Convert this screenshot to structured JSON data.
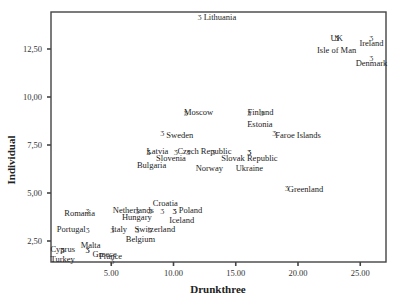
{
  "chart_data": {
    "type": "scatter",
    "title": "",
    "xlabel": "Drunkthree",
    "ylabel": "Individual",
    "xlim": [
      0.2,
      27.2
    ],
    "ylim": [
      1.4,
      14.4
    ],
    "x_ticks": [
      5,
      10,
      15,
      20,
      25
    ],
    "x_tick_labels": [
      "5.00",
      "10.00",
      "15.00",
      "20.00",
      "25.00"
    ],
    "y_ticks": [
      2.5,
      5,
      7.5,
      10,
      12.5
    ],
    "y_tick_labels": [
      "2,50",
      "5,00",
      "7,50",
      "10,00",
      "12,50"
    ],
    "grid": false,
    "legend": null,
    "points": [
      {
        "label": "Lithuania",
        "x": 12.1,
        "y": 14.2,
        "dx": 4,
        "dy": 4,
        "anchor": "start"
      },
      {
        "label": "UK",
        "x": 23.1,
        "y": 13.1,
        "dx": -6,
        "dy": 4,
        "anchor": "start"
      },
      {
        "label": "Isle of Man",
        "x": 23.1,
        "y": 13.1,
        "dx": 0,
        "dy": 16,
        "anchor": "middle"
      },
      {
        "label": "Ireland",
        "x": 25.9,
        "y": 13.1,
        "dx": 0,
        "dy": 9,
        "anchor": "middle"
      },
      {
        "label": "Denmark",
        "x": 25.9,
        "y": 12.1,
        "dx": 0,
        "dy": 9,
        "anchor": "middle"
      },
      {
        "label": "Moscow",
        "x": 11.0,
        "y": 9.2,
        "dx": -2,
        "dy": 3,
        "anchor": "start"
      },
      {
        "label": "Finland",
        "x": 16.1,
        "y": 9.2,
        "dx": -2,
        "dy": 3,
        "anchor": "start"
      },
      {
        "label": "Estonia",
        "x": 17.1,
        "y": 9.2,
        "dx": -2,
        "dy": 15,
        "anchor": "middle"
      },
      {
        "label": "Sweden",
        "x": 9.1,
        "y": 8.2,
        "dx": 4,
        "dy": 6,
        "anchor": "start"
      },
      {
        "label": "Faroe Islands",
        "x": 18.1,
        "y": 8.2,
        "dx": 1,
        "dy": 6,
        "anchor": "start"
      },
      {
        "label": "Latvia",
        "x": 8.0,
        "y": 7.2,
        "dx": -2,
        "dy": 3,
        "anchor": "start"
      },
      {
        "label": "Bulgaria",
        "x": 8.0,
        "y": 7.2,
        "dx": 3,
        "dy": 17,
        "anchor": "middle"
      },
      {
        "label": "Slovenia",
        "x": 10.2,
        "y": 7.2,
        "dx": -5,
        "dy": 10,
        "anchor": "middle"
      },
      {
        "label": "Czech Republic",
        "x": 11.2,
        "y": 7.2,
        "dx": -11,
        "dy": 3,
        "anchor": "start"
      },
      {
        "label": "Norway",
        "x": 13.2,
        "y": 7.2,
        "dx": -4,
        "dy": 20,
        "anchor": "middle"
      },
      {
        "label": "Slovak Republic",
        "x": 16.1,
        "y": 7.2,
        "dx": 0,
        "dy": 10,
        "anchor": "middle"
      },
      {
        "label": "Ukraine",
        "x": 16.1,
        "y": 7.2,
        "dx": 0,
        "dy": 20,
        "anchor": "middle"
      },
      {
        "label": "Greenland",
        "x": 19.1,
        "y": 5.3,
        "dx": 1,
        "dy": 5,
        "anchor": "start"
      },
      {
        "label": "Croatia",
        "x": 9.1,
        "y": 4.1,
        "dx": 3,
        "dy": -4,
        "anchor": "middle"
      },
      {
        "label": "Poland",
        "x": 10.1,
        "y": 4.1,
        "dx": 4,
        "dy": 3,
        "anchor": "start"
      },
      {
        "label": "Iceland",
        "x": 10.1,
        "y": 4.1,
        "dx": 7,
        "dy": 13,
        "anchor": "middle"
      },
      {
        "label": "Netherlands",
        "x": 7.1,
        "y": 4.1,
        "dx": -4,
        "dy": 3,
        "anchor": "middle"
      },
      {
        "label": "Hungary",
        "x": 8.1,
        "y": 4.1,
        "dx": -13,
        "dy": 10,
        "anchor": "middle"
      },
      {
        "label": "Romania",
        "x": 3.1,
        "y": 4.1,
        "dx": -8,
        "dy": 6,
        "anchor": "middle"
      },
      {
        "label": "Portugal",
        "x": 3.1,
        "y": 3.1,
        "dx": -2,
        "dy": 3,
        "anchor": "end"
      },
      {
        "label": "Italy",
        "x": 5.1,
        "y": 3.1,
        "dx": -1,
        "dy": 3,
        "anchor": "start"
      },
      {
        "label": "Belgium",
        "x": 7.1,
        "y": 3.1,
        "dx": 3,
        "dy": 13,
        "anchor": "middle"
      },
      {
        "label": "Switzerland",
        "x": 8.1,
        "y": 3.1,
        "dx": 5,
        "dy": 3,
        "anchor": "middle"
      },
      {
        "label": "Malta",
        "x": 3.1,
        "y": 2.1,
        "dx": 3,
        "dy": -1,
        "anchor": "middle"
      },
      {
        "label": "Greece",
        "x": 3.1,
        "y": 2.1,
        "dx": 5,
        "dy": 8,
        "anchor": "start"
      },
      {
        "label": "Cyprus",
        "x": 1.1,
        "y": 2.1,
        "dx": 0,
        "dy": 3,
        "anchor": "middle"
      },
      {
        "label": "Turkey",
        "x": 1.1,
        "y": 2.1,
        "dx": 0,
        "dy": 13,
        "anchor": "middle"
      },
      {
        "label": "France",
        "x": 5.1,
        "y": 1.5,
        "dx": -2,
        "dy": -1,
        "anchor": "middle"
      }
    ]
  },
  "style": {
    "frame_color": "#444444",
    "text_color": "#222222",
    "marker_glyph": "Ʒ"
  }
}
